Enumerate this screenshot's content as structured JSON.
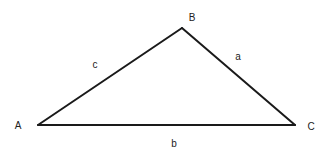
{
  "diagram": {
    "type": "triangle",
    "vertices": [
      {
        "id": "A",
        "label": "A",
        "x": 38,
        "y": 125,
        "label_x": 18,
        "label_y": 129
      },
      {
        "id": "B",
        "label": "B",
        "x": 182,
        "y": 28,
        "label_x": 192,
        "label_y": 21
      },
      {
        "id": "C",
        "label": "C",
        "x": 295,
        "y": 125,
        "label_x": 311,
        "label_y": 130
      }
    ],
    "sides": [
      {
        "id": "a",
        "label": "a",
        "from": "B",
        "to": "C",
        "label_x": 238,
        "label_y": 60
      },
      {
        "id": "b",
        "label": "b",
        "from": "A",
        "to": "C",
        "label_x": 174,
        "label_y": 147
      },
      {
        "id": "c",
        "label": "c",
        "from": "A",
        "to": "B",
        "label_x": 95,
        "label_y": 68
      }
    ]
  }
}
